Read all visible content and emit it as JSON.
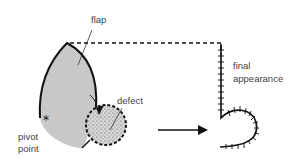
{
  "labels": {
    "flap": "flap",
    "defect": "defect",
    "pivot_line1": "pivot",
    "pivot_line2": "point",
    "final_line1": "final",
    "final_line2": "appearance"
  },
  "colors": {
    "flap_fill": "#c8c8c8",
    "stroke": "#111111",
    "defect_fill": "#d4d4d4",
    "label_text": "#444444"
  }
}
